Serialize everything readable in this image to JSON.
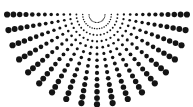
{
  "figure": {
    "background_color": "#ffffff",
    "dot_color": "#141414",
    "canvas": {
      "width": 193,
      "height": 107
    }
  },
  "chart_data": {
    "type": "scatter",
    "subtitle": "",
    "xlabel": "",
    "ylabel": "",
    "xlim": [
      0,
      193
    ],
    "ylim": [
      0,
      107
    ],
    "grid": false,
    "legend": null,
    "annotations": [],
    "coordinate_system": "polar-semicircle",
    "center": {
      "x": 97,
      "y": 14.5
    },
    "angle_start_deg": 0,
    "angle_end_deg": 180,
    "ray_count": 19,
    "angle_step_deg": 10,
    "ring_count": 14,
    "radius_start": 8,
    "radius_step": 6.3,
    "dot_radius_min": 0.55,
    "dot_radius_max": 3.1,
    "dot_radius_growth": "linear-with-radius",
    "tick_labels": {
      "x": [],
      "y": []
    },
    "series": [
      {
        "name": "rays",
        "angles_deg": [
          0,
          10,
          20,
          30,
          40,
          50,
          60,
          70,
          80,
          90,
          100,
          110,
          120,
          130,
          140,
          150,
          160,
          170,
          180
        ],
        "radii": [
          8.0,
          14.3,
          20.6,
          26.9,
          33.2,
          39.5,
          45.8,
          52.1,
          58.4,
          64.7,
          71.0,
          77.3,
          83.6,
          89.9
        ]
      }
    ]
  }
}
